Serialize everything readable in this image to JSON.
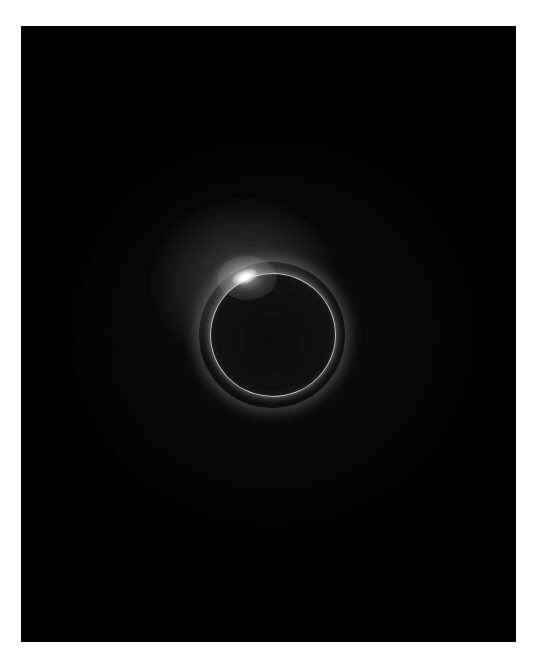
{
  "image": {
    "subject": "Total solar eclipse, diamond ring effect",
    "elements": {
      "background": "black sky",
      "moon": "dark disk with thin bright rim",
      "diamond": "bright flare at upper-left of rim",
      "corona": "soft glow concentrated upper-left"
    },
    "colors": {
      "sky": "#010101",
      "rim": "#e1e1e1",
      "diamond": "#ffffff",
      "border": "#ffffff"
    }
  }
}
